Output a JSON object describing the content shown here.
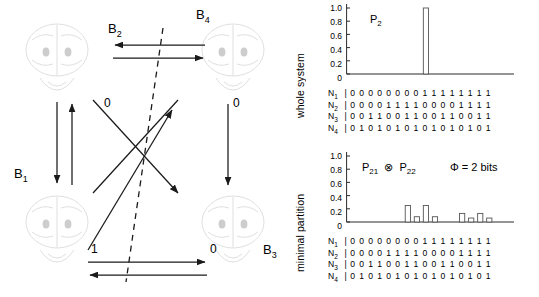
{
  "network": {
    "nodes": [
      {
        "id": "B1",
        "label": "B",
        "sub": "1"
      },
      {
        "id": "B2",
        "label": "B",
        "sub": "2"
      },
      {
        "id": "B3",
        "label": "B",
        "sub": "3"
      },
      {
        "id": "B4",
        "label": "B",
        "sub": "4"
      }
    ],
    "edge_labels": [
      {
        "id": "label-top-left",
        "text": "0"
      },
      {
        "id": "label-top-right",
        "text": "0"
      },
      {
        "id": "label-bottom-left",
        "text": "1"
      },
      {
        "id": "label-bottom-right",
        "text": "0"
      }
    ],
    "partition_line": "dashed"
  },
  "plots": {
    "whole_system": {
      "axis_title": "whole system",
      "annotation": "P",
      "annotation_sub": "2",
      "yticks": [
        "1.0",
        "0.8",
        "0.6",
        "0.4",
        "0.2",
        "0"
      ]
    },
    "minimal_partition": {
      "axis_title": "minimal partition",
      "annotation_left": "P",
      "annotation_left_sub": "21",
      "annotation_op": "⊗",
      "annotation_right": "P",
      "annotation_right_sub": "22",
      "phi_text": "Φ = 2 bits",
      "yticks": [
        "1.0",
        "0.8",
        "0.6",
        "0.4",
        "0.2",
        "0"
      ]
    },
    "state_table": [
      {
        "name": "N",
        "sub": "1",
        "bits": "0000000011111111"
      },
      {
        "name": "N",
        "sub": "2",
        "bits": "0000111100001111"
      },
      {
        "name": "N",
        "sub": "3",
        "bits": "0011001100110011"
      },
      {
        "name": "N",
        "sub": "4",
        "bits": "0101010101010101"
      }
    ]
  },
  "chart_data": [
    {
      "type": "bar",
      "title": "whole system",
      "annotation": "P2",
      "xlabel": "",
      "ylabel": "",
      "ylim": [
        0,
        1.0
      ],
      "yticks": [
        0,
        0.2,
        0.4,
        0.6,
        0.8,
        1.0
      ],
      "grid": false,
      "categories": [
        "0000",
        "0001",
        "0010",
        "0011",
        "0100",
        "0101",
        "0110",
        "0111",
        "1000",
        "1001",
        "1010",
        "1011",
        "1100",
        "1101",
        "1110",
        "1111"
      ],
      "values": [
        0,
        0,
        0,
        0,
        0,
        0,
        0,
        0,
        1.0,
        0,
        0,
        0,
        0,
        0,
        0,
        0
      ]
    },
    {
      "type": "bar",
      "title": "minimal partition",
      "annotation": "P21 ⊗ P22",
      "phi": "Φ = 2 bits",
      "xlabel": "",
      "ylabel": "",
      "ylim": [
        0,
        1.0
      ],
      "yticks": [
        0,
        0.2,
        0.4,
        0.6,
        0.8,
        1.0
      ],
      "grid": false,
      "categories": [
        "0000",
        "0001",
        "0010",
        "0011",
        "0100",
        "0101",
        "0110",
        "0111",
        "1000",
        "1001",
        "1010",
        "1011",
        "1100",
        "1101",
        "1110",
        "1111"
      ],
      "values": [
        0,
        0,
        0,
        0,
        0,
        0,
        0.25,
        0.08,
        0.25,
        0.08,
        0,
        0,
        0.13,
        0.06,
        0.13,
        0.06
      ]
    }
  ]
}
